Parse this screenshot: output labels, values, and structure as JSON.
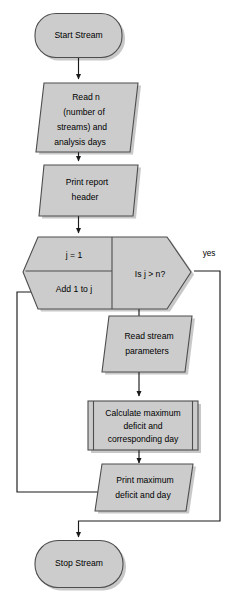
{
  "diagram": {
    "background_color": "#ffffff",
    "shape_fill_color": "#cccccc",
    "shape_border_color": "#4d4d4d",
    "connector_color": "#1a1a1a"
  },
  "nodes": {
    "start": {
      "label": "Start Stream",
      "shape": "terminator"
    },
    "read_inputs": {
      "line1": "Read n",
      "line2": "(number of",
      "line3": "streams) and",
      "line4": "analysis days",
      "shape": "input-output"
    },
    "print_header": {
      "line1": "Print report",
      "line2": "header",
      "shape": "input-output"
    },
    "loop": {
      "init": "j = 1",
      "increment": "Add 1 to j",
      "condition": "Is j > n?",
      "shape": "loop-hexagon"
    },
    "read_params": {
      "line1": "Read stream",
      "line2": "parameters",
      "shape": "input-output"
    },
    "calculate": {
      "line1": "Calculate maximum",
      "line2": "deficit and",
      "line3": "corresponding day",
      "shape": "predefined-process"
    },
    "print_results": {
      "line1": "Print maximum",
      "line2": "deficit and day",
      "shape": "input-output"
    },
    "stop": {
      "label": "Stop Stream",
      "shape": "terminator"
    }
  },
  "edge_labels": {
    "yes": "yes",
    "no": "no"
  }
}
